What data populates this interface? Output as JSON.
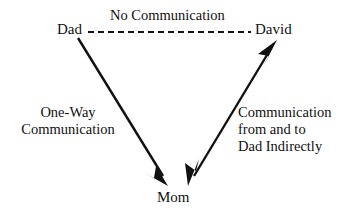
{
  "diagram": {
    "canvas": {
      "width": 347,
      "height": 219,
      "background": "#ffffff"
    },
    "stroke_color": "#111111",
    "nodes": [
      {
        "id": "dad",
        "label": "Dad"
      },
      {
        "id": "david",
        "label": "David"
      },
      {
        "id": "mom",
        "label": "Mom"
      }
    ],
    "edges": [
      {
        "id": "dad-david",
        "from": "Dad",
        "to": "David",
        "style": "dashed",
        "arrowheads": "none",
        "label": "No Communication"
      },
      {
        "id": "dad-mom",
        "from": "Dad",
        "to": "Mom",
        "style": "solid",
        "arrowheads": "end",
        "label_line1": "One-Way",
        "label_line2": "Communication"
      },
      {
        "id": "mom-david",
        "from": "Mom",
        "to": "David",
        "style": "solid",
        "arrowheads": "both",
        "label_line1": "Communication",
        "label_line2": "from and to",
        "label_line3": "Dad Indirectly"
      }
    ]
  }
}
